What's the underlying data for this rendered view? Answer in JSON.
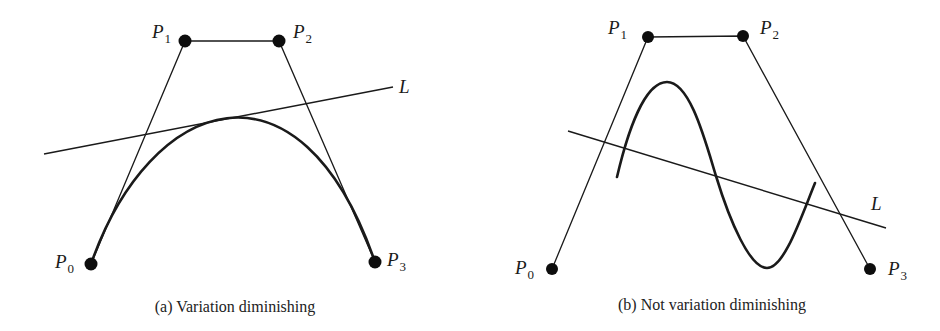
{
  "panels": [
    {
      "id": "a",
      "caption": "(a) Variation diminishing",
      "control_points": [
        {
          "label": "P",
          "sub": "0"
        },
        {
          "label": "P",
          "sub": "1"
        },
        {
          "label": "P",
          "sub": "2"
        },
        {
          "label": "P",
          "sub": "3"
        }
      ],
      "line_label": "L"
    },
    {
      "id": "b",
      "caption": "(b) Not variation diminishing",
      "control_points": [
        {
          "label": "P",
          "sub": "0"
        },
        {
          "label": "P",
          "sub": "1"
        },
        {
          "label": "P",
          "sub": "2"
        },
        {
          "label": "P",
          "sub": "3"
        }
      ],
      "line_label": "L"
    }
  ],
  "colors": {
    "ink": "#1a1a1a",
    "background": "#ffffff"
  }
}
